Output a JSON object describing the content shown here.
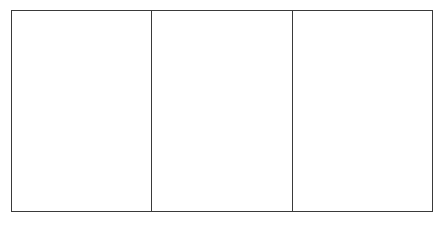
{
  "diagram": {
    "panels": [
      {
        "label": ""
      },
      {
        "label": ""
      },
      {
        "label": ""
      }
    ],
    "border_color": "#3a3a3a",
    "background": "#ffffff"
  }
}
